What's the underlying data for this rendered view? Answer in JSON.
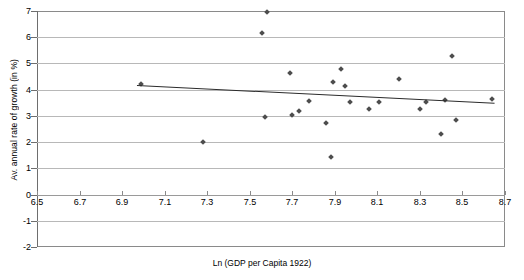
{
  "chart_data": {
    "type": "scatter",
    "title": "",
    "xlabel": "Ln (GDP per Capita 1922)",
    "ylabel": "Av. annual rate of growth (in %)",
    "xlim": [
      6.5,
      8.7
    ],
    "ylim": [
      -2,
      7
    ],
    "grid": true,
    "legend": "none",
    "xticks": [
      "6.5",
      "6.7",
      "6.9",
      "7.1",
      "7.3",
      "7.5",
      "7.7",
      "7.9",
      "8.1",
      "8.3",
      "8.5",
      "8.7"
    ],
    "xtick_values": [
      6.5,
      6.7,
      6.9,
      7.1,
      7.3,
      7.5,
      7.7,
      7.9,
      8.1,
      8.3,
      8.5,
      8.7
    ],
    "yticks": [
      "7",
      "6",
      "5",
      "4",
      "3",
      "2",
      "1",
      "0",
      "-1",
      "-2"
    ],
    "ytick_values": [
      7,
      6,
      5,
      4,
      3,
      2,
      1,
      0,
      -1,
      -2
    ],
    "marker": "diamond",
    "marker_color": "#4d4d4d",
    "points": [
      {
        "x": 6.99,
        "y": 4.22
      },
      {
        "x": 7.28,
        "y": 2.0
      },
      {
        "x": 7.58,
        "y": 6.95
      },
      {
        "x": 7.56,
        "y": 6.18
      },
      {
        "x": 7.57,
        "y": 2.95
      },
      {
        "x": 7.69,
        "y": 4.62
      },
      {
        "x": 7.7,
        "y": 3.05
      },
      {
        "x": 7.73,
        "y": 3.2
      },
      {
        "x": 7.78,
        "y": 3.58
      },
      {
        "x": 7.86,
        "y": 2.72
      },
      {
        "x": 7.88,
        "y": 1.42
      },
      {
        "x": 7.89,
        "y": 4.3
      },
      {
        "x": 7.93,
        "y": 4.78
      },
      {
        "x": 7.95,
        "y": 4.15
      },
      {
        "x": 7.97,
        "y": 3.52
      },
      {
        "x": 8.06,
        "y": 3.25
      },
      {
        "x": 8.11,
        "y": 3.53
      },
      {
        "x": 8.2,
        "y": 4.42
      },
      {
        "x": 8.3,
        "y": 3.25
      },
      {
        "x": 8.33,
        "y": 3.52
      },
      {
        "x": 8.4,
        "y": 2.3
      },
      {
        "x": 8.42,
        "y": 3.6
      },
      {
        "x": 8.45,
        "y": 5.28
      },
      {
        "x": 8.47,
        "y": 2.85
      },
      {
        "x": 8.64,
        "y": 3.65
      }
    ],
    "trendline": {
      "color": "#2b2b2b",
      "x0": 6.97,
      "y0": 4.18,
      "x1": 8.65,
      "y1": 3.5
    }
  }
}
